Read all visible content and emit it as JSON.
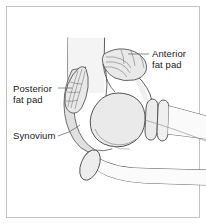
{
  "figure": {
    "frame_color": "#c8c8c8",
    "background_color": "#ffffff",
    "line_color": "#3a3a3a",
    "fill_light": "#efefef",
    "fill_mid": "#e2e2e2",
    "fill_fatpad": "#e8e8e8",
    "leader_color": "#555555"
  },
  "labels": {
    "anterior": {
      "line1": "Anterior",
      "line2": "fat pad"
    },
    "posterior": {
      "line1": "Posterior",
      "line2": "fat pad"
    },
    "synovium": {
      "line1": "Synovium"
    }
  },
  "structures": [
    {
      "name": "humerus-shaft",
      "label": "Humerus shaft"
    },
    {
      "name": "anterior-fat-pad",
      "label": "Anterior fat pad"
    },
    {
      "name": "posterior-fat-pad",
      "label": "Posterior fat pad"
    },
    {
      "name": "synovium-band",
      "label": "Synovium"
    },
    {
      "name": "capitellum-trochlea",
      "label": "Distal humerus articular surface"
    },
    {
      "name": "radial-head",
      "label": "Radial head"
    },
    {
      "name": "radial-neck",
      "label": "Radial neck"
    },
    {
      "name": "radius-shaft",
      "label": "Radius shaft"
    },
    {
      "name": "olecranon",
      "label": "Olecranon"
    },
    {
      "name": "ulna-shaft",
      "label": "Ulna shaft"
    },
    {
      "name": "coronoid-ossicle",
      "label": "Coronoid ossicle"
    }
  ]
}
